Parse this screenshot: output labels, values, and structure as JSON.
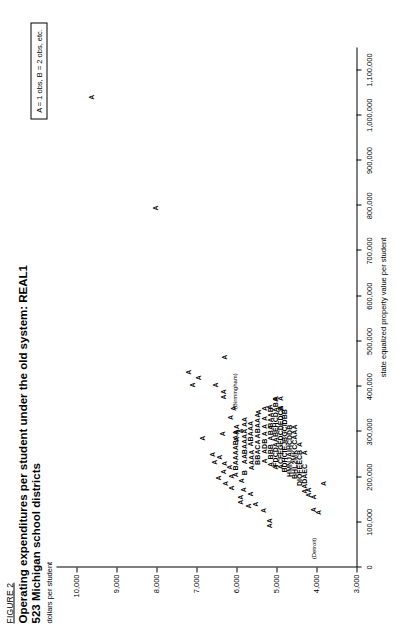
{
  "figure": {
    "number": "FIGURE 2",
    "title_line1": "Operating expenditures per student under the old system: REAL1",
    "title_line2": "523 Michigan school districts",
    "y_caption": "dollars per student",
    "legend": "A = 1 obs, B = 2 obs, etc."
  },
  "chart_data": {
    "type": "scatter",
    "xlabel": "state equalized property value per student",
    "ylabel": "dollars per student",
    "xlim": [
      0,
      1150000
    ],
    "ylim": [
      3000,
      10500
    ],
    "grid": false,
    "legend_position": "top-right",
    "legend_note": "A = 1 obs, B = 2 obs, etc.",
    "xticks": [
      0,
      100000,
      200000,
      300000,
      400000,
      500000,
      600000,
      700000,
      800000,
      900000,
      1000000,
      1100000
    ],
    "xticklabels": [
      "0",
      "100,000",
      "200,000",
      "300,000",
      "400,000",
      "500,000",
      "600,000",
      "700,000",
      "800,000",
      "900,000",
      "1,000,000",
      "1,100,000"
    ],
    "yticks": [
      3000,
      4000,
      5000,
      6000,
      7000,
      8000,
      9000,
      10000
    ],
    "yticklabels": [
      "3,000",
      "4,000",
      "5,000",
      "6,000",
      "7,000",
      "8,000",
      "9,000",
      "10,000"
    ],
    "annotations": [
      {
        "text": "(Birmingham)",
        "x": 390000,
        "y": 6230
      },
      {
        "text": "(Detroit)",
        "x": 42000,
        "y": 4255
      }
    ],
    "points": [
      {
        "label": "A",
        "x": 1040000,
        "y": 9620
      },
      {
        "label": "A",
        "x": 795000,
        "y": 8020
      },
      {
        "label": "A",
        "x": 432000,
        "y": 7210
      },
      {
        "label": "A",
        "x": 404000,
        "y": 7090
      },
      {
        "label": "A",
        "x": 420000,
        "y": 6960
      },
      {
        "label": "A",
        "x": 286000,
        "y": 6840
      },
      {
        "label": "A",
        "x": 404000,
        "y": 6530
      },
      {
        "label": "AA",
        "x": 383000,
        "y": 6320
      },
      {
        "label": "A",
        "x": 465000,
        "y": 6300
      },
      {
        "label": "A",
        "x": 352000,
        "y": 6080
      },
      {
        "label": "A",
        "x": 284000,
        "y": 6000
      },
      {
        "label": "A",
        "x": 296000,
        "y": 6350
      },
      {
        "label": "A",
        "x": 250000,
        "y": 6610
      },
      {
        "label": "A",
        "x": 233000,
        "y": 6560
      },
      {
        "label": "A",
        "x": 244000,
        "y": 6430
      },
      {
        "label": "A",
        "x": 212000,
        "y": 6330
      },
      {
        "label": "A",
        "x": 230000,
        "y": 6300
      },
      {
        "label": "A",
        "x": 198000,
        "y": 6460
      },
      {
        "label": "A",
        "x": 186000,
        "y": 6280
      },
      {
        "label": "A",
        "x": 176000,
        "y": 6130
      },
      {
        "label": "A",
        "x": 202000,
        "y": 6130
      },
      {
        "label": "A",
        "x": 222000,
        "y": 6170
      },
      {
        "label": "A BAAAABAA",
        "x": 252000,
        "y": 6020,
        "run": true
      },
      {
        "label": "AA",
        "x": 306000,
        "y": 6010
      },
      {
        "label": "AA",
        "x": 150000,
        "y": 5900
      },
      {
        "label": "A",
        "x": 192000,
        "y": 5880
      },
      {
        "label": "A",
        "x": 172000,
        "y": 5820
      },
      {
        "label": "B",
        "x": 210000,
        "y": 5790
      },
      {
        "label": "AA",
        "x": 240000,
        "y": 5790
      },
      {
        "label": "BA",
        "x": 262000,
        "y": 5790
      },
      {
        "label": "AAA",
        "x": 290000,
        "y": 5800
      },
      {
        "label": "AA",
        "x": 322000,
        "y": 5800
      },
      {
        "label": "A",
        "x": 136000,
        "y": 5690
      },
      {
        "label": "A",
        "x": 163000,
        "y": 5660
      },
      {
        "label": "AAAA",
        "x": 238000,
        "y": 5630
      },
      {
        "label": "ABAAA",
        "x": 296000,
        "y": 5640
      },
      {
        "label": "A",
        "x": 140000,
        "y": 5520
      },
      {
        "label": "BBA",
        "x": 244000,
        "y": 5480
      },
      {
        "label": "CA",
        "x": 272000,
        "y": 5480
      },
      {
        "label": "ABAAA",
        "x": 314000,
        "y": 5470
      },
      {
        "label": "A",
        "x": 344000,
        "y": 5460
      },
      {
        "label": "A",
        "x": 126000,
        "y": 5330
      },
      {
        "label": "A",
        "x": 236000,
        "y": 5310
      },
      {
        "label": "ADB",
        "x": 268000,
        "y": 5310
      },
      {
        "label": "A",
        "x": 296000,
        "y": 5310
      },
      {
        "label": "A",
        "x": 312000,
        "y": 5310
      },
      {
        "label": "A",
        "x": 330000,
        "y": 5310
      },
      {
        "label": "A",
        "x": 352000,
        "y": 5300
      },
      {
        "label": "AA",
        "x": 98000,
        "y": 5180
      },
      {
        "label": "A",
        "x": 228000,
        "y": 5150
      },
      {
        "label": "BBB",
        "x": 256000,
        "y": 5150
      },
      {
        "label": "A",
        "x": 286000,
        "y": 5150
      },
      {
        "label": "BA",
        "x": 304000,
        "y": 5150
      },
      {
        "label": "BAAB",
        "x": 332000,
        "y": 5150
      },
      {
        "label": "A",
        "x": 222000,
        "y": 5030
      },
      {
        "label": "FDCDAABEHCDABA",
        "x": 300000,
        "y": 5030,
        "run": true
      },
      {
        "label": "ACFEGFDCDEDCA",
        "x": 288000,
        "y": 4910,
        "run": true
      },
      {
        "label": "B",
        "x": 352000,
        "y": 4910
      },
      {
        "label": "A",
        "x": 374000,
        "y": 4910
      },
      {
        "label": "BDHCIEJBGCIDBB",
        "x": 280000,
        "y": 4790,
        "run": true
      },
      {
        "label": "HMNJAIHCDDB",
        "x": 258000,
        "y": 4670,
        "run": true
      },
      {
        "label": "BHL2MKCCAAA",
        "x": 256000,
        "y": 4550,
        "run": true
      },
      {
        "label": "DIOFEECB",
        "x": 220000,
        "y": 4430,
        "run": true
      },
      {
        "label": "A",
        "x": 272000,
        "y": 4430
      },
      {
        "label": "AADAEC",
        "x": 196000,
        "y": 4310,
        "run": true
      },
      {
        "label": "A",
        "x": 254000,
        "y": 4310
      },
      {
        "label": "AA",
        "x": 166000,
        "y": 4190
      },
      {
        "label": "A",
        "x": 128000,
        "y": 4070
      },
      {
        "label": "A",
        "x": 156000,
        "y": 4070
      },
      {
        "label": "A",
        "x": 122000,
        "y": 3950
      },
      {
        "label": "A",
        "x": 186000,
        "y": 3830
      },
      {
        "label": "A",
        "x": 302000,
        "y": 5900
      },
      {
        "label": "A",
        "x": 332000,
        "y": 6150
      },
      {
        "label": "A",
        "x": 355000,
        "y": 5180
      },
      {
        "label": "A",
        "x": 374000,
        "y": 5030
      }
    ]
  }
}
